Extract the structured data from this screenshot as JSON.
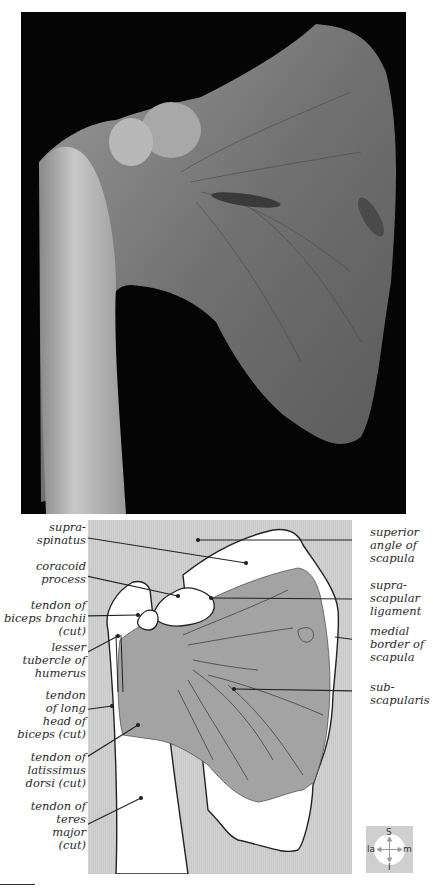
{
  "figure": {
    "photo": {
      "subject": "dissected right shoulder, anterior view, subscapularis region",
      "background_color": "#050505"
    },
    "diagram": {
      "background_color": "#cdcdcd",
      "muscle_fill": "#9e9e9e",
      "bone_fill": "#ffffff",
      "labels_left": [
        {
          "id": "supraspinatus",
          "text": "supra-\nspinatus"
        },
        {
          "id": "coracoid-process",
          "text": "coracoid\nprocess"
        },
        {
          "id": "tendon-biceps-brachii",
          "text": "tendon of\nbiceps brachii\n(cut)"
        },
        {
          "id": "lesser-tubercle",
          "text": "lesser\ntubercle of\nhumerus"
        },
        {
          "id": "tendon-long-head-biceps",
          "text": "tendon\nof long\nhead of\nbiceps (cut)"
        },
        {
          "id": "tendon-latissimus-dorsi",
          "text": "tendon of\nlatissimus\ndorsi (cut)"
        },
        {
          "id": "tendon-teres-major",
          "text": "tendon of\nteres\nmajor\n(cut)"
        }
      ],
      "labels_right": [
        {
          "id": "superior-angle-scapula",
          "text": "superior\nangle of\nscapula"
        },
        {
          "id": "suprascapular-ligament",
          "text": "supra-\nscapular\nligament"
        },
        {
          "id": "medial-border-scapula",
          "text": "medial\nborder of\nscapula"
        },
        {
          "id": "subscapularis",
          "text": "sub-\nscapularis"
        }
      ]
    },
    "compass": {
      "superior": "S",
      "inferior": "I",
      "lateral": "la",
      "medial": "m"
    }
  }
}
